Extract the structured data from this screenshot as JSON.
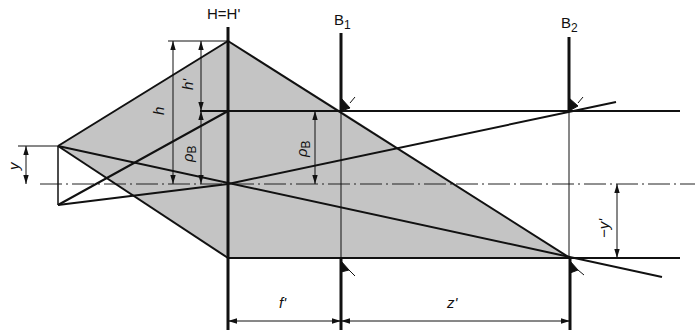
{
  "diagram": {
    "colors": {
      "shade": "#c8c8c8",
      "line": "#111111",
      "background": "#ffffff"
    },
    "labels": {
      "principal_plane": "H=H'",
      "stop1_main": "B",
      "stop1_sub": "1",
      "stop2_main": "B",
      "stop2_sub": "2",
      "h": "h",
      "h_prime": "h'",
      "rho_b_left_main": "ρ",
      "rho_b_left_sub": "B",
      "rho_b_right_main": "ρ",
      "rho_b_right_sub": "B",
      "y": "y",
      "neg_y_prime": "−y'",
      "f_prime": "f'",
      "z_prime": "z'"
    }
  }
}
